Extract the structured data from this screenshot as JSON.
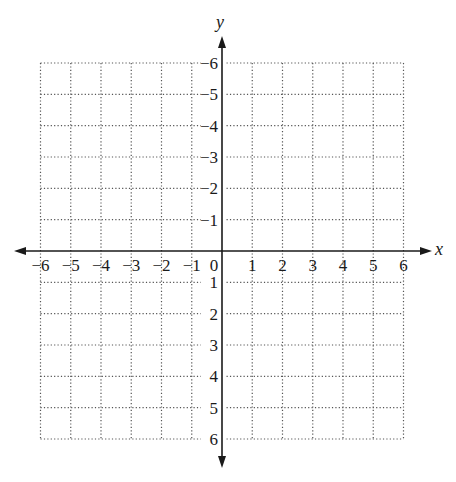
{
  "chart_data": {
    "type": "scatter",
    "title": "",
    "subtitle": "",
    "xlabel": "x",
    "ylabel": "y",
    "xlim": [
      -6,
      6
    ],
    "ylim": [
      -6,
      6
    ],
    "grid": true,
    "grid_style": "dotted",
    "legend": null,
    "x_ticks": [
      -6,
      -5,
      -4,
      -3,
      -2,
      -1,
      0,
      1,
      2,
      3,
      4,
      5,
      6
    ],
    "y_ticks": [
      -6,
      -5,
      -4,
      -3,
      -2,
      -1,
      1,
      2,
      3,
      4,
      5,
      6
    ],
    "x_tick_labels": [
      "−6",
      "−5",
      "−4",
      "−3",
      "−2",
      "−1",
      "0",
      "1",
      "2",
      "3",
      "4",
      "5",
      "6"
    ],
    "y_tick_labels": [
      "6",
      "5",
      "4",
      "3",
      "2",
      "1",
      "−1",
      "−2",
      "−3",
      "−4",
      "−5",
      "−6"
    ],
    "series": [],
    "annotations": [
      "Blank coordinate plane with arrowed axes"
    ]
  },
  "colors": {
    "axis": "#1a1a1a",
    "grid": "#555555",
    "background": "#ffffff"
  }
}
